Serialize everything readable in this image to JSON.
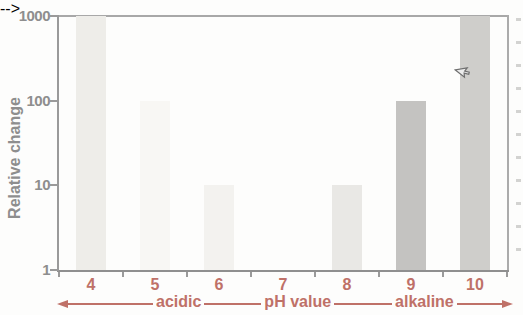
{
  "chart_data": {
    "type": "bar",
    "title": "",
    "ylabel": "Relative change",
    "xlabel": "pH value",
    "yscale": "log",
    "ylim": [
      1,
      1000
    ],
    "yticks": [
      "1",
      "10",
      "100",
      "1000"
    ],
    "categories": [
      "4",
      "5",
      "6",
      "7",
      "8",
      "9",
      "10"
    ],
    "values": [
      1000,
      100,
      10,
      1,
      10,
      100,
      1000
    ],
    "bar_colors": [
      "#eeede9",
      "#f8f7f4",
      "#f3f2ef",
      "#ffffff",
      "#e9e8e5",
      "#c4c3c1",
      "#cfcecb"
    ],
    "region_labels": {
      "left": "acidic",
      "right": "alkaline"
    },
    "axis_text_color": "#bf7168",
    "value_text_color": "#8e8e8e",
    "grid": false,
    "legend_position": "none"
  }
}
